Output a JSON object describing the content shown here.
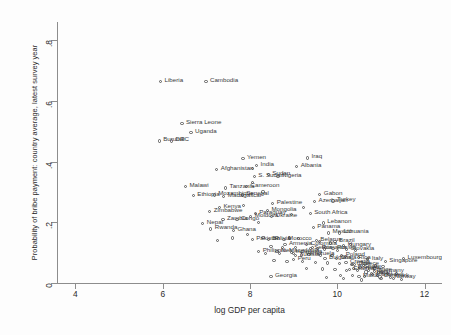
{
  "chart_data": {
    "type": "scatter",
    "title": "",
    "xlabel": "log GDP per capita",
    "ylabel": "Probability of bribe payment: country average, latest survey year",
    "xlim": [
      3.6,
      12.4
    ],
    "ylim": [
      0,
      0.86
    ],
    "xticks": [
      4,
      6,
      8,
      10,
      12
    ],
    "xticklabels": [
      "4",
      "6",
      "8",
      "10",
      "12"
    ],
    "yticks": [
      0,
      0.2,
      0.4,
      0.6,
      0.8
    ],
    "yticklabels": [
      "0",
      ".2",
      ".4",
      ".6",
      ".8"
    ],
    "grid": false,
    "legend": null,
    "marker": "open-circle",
    "marker_color": "#5a5a5a",
    "label_color": "#3a3a3a",
    "points": [
      {
        "label": "Liberia",
        "x": 5.95,
        "y": 0.665,
        "side": "right"
      },
      {
        "label": "Cambodia",
        "x": 6.99,
        "y": 0.665,
        "side": "right"
      },
      {
        "label": "Sierra Leone",
        "x": 6.44,
        "y": 0.525,
        "side": "right"
      },
      {
        "label": "Uganda",
        "x": 6.65,
        "y": 0.497,
        "side": "right"
      },
      {
        "label": "Burundi",
        "x": 5.92,
        "y": 0.468,
        "side": "right"
      },
      {
        "label": "DRC",
        "x": 6.2,
        "y": 0.468,
        "side": "right"
      },
      {
        "label": "Yemen",
        "x": 7.84,
        "y": 0.41,
        "side": "right"
      },
      {
        "label": "Iraq",
        "x": 9.32,
        "y": 0.412,
        "side": "right"
      },
      {
        "label": "India",
        "x": 8.15,
        "y": 0.388,
        "side": "right"
      },
      {
        "label": "Liberia2",
        "x": 8.05,
        "y": 0.378,
        "side": "right"
      },
      {
        "label": "Albania",
        "x": 9.07,
        "y": 0.385,
        "side": "right"
      },
      {
        "label": "Afghanistan",
        "x": 7.24,
        "y": 0.375,
        "side": "right"
      },
      {
        "label": "Sudan",
        "x": 8.42,
        "y": 0.358,
        "side": "right"
      },
      {
        "label": "S. Sudan",
        "x": 8.1,
        "y": 0.352,
        "side": "right"
      },
      {
        "label": "Nigeria",
        "x": 8.64,
        "y": 0.352,
        "side": "right"
      },
      {
        "label": "Malawi",
        "x": 6.52,
        "y": 0.318,
        "side": "right"
      },
      {
        "label": "Tanzania",
        "x": 7.44,
        "y": 0.313,
        "side": "right"
      },
      {
        "label": "Cameroon",
        "x": 7.92,
        "y": 0.318,
        "side": "right"
      },
      {
        "label": "Ethiopia",
        "x": 6.7,
        "y": 0.288,
        "side": "right"
      },
      {
        "label": "Mozambique",
        "x": 7.18,
        "y": 0.29,
        "side": "right"
      },
      {
        "label": "Senegal",
        "x": 7.82,
        "y": 0.29,
        "side": "right"
      },
      {
        "label": "Madagascar",
        "x": 7.4,
        "y": 0.285,
        "side": "right"
      },
      {
        "label": "Gabon",
        "x": 9.6,
        "y": 0.292,
        "side": "right"
      },
      {
        "label": "Azerbaijan",
        "x": 9.48,
        "y": 0.268,
        "side": "right"
      },
      {
        "label": "Turkey",
        "x": 9.9,
        "y": 0.27,
        "side": "right"
      },
      {
        "label": "Palestine",
        "x": 8.52,
        "y": 0.262,
        "side": "right"
      },
      {
        "label": "Kenya",
        "x": 7.3,
        "y": 0.248,
        "side": "right"
      },
      {
        "label": "Mongolia",
        "x": 8.4,
        "y": 0.24,
        "side": "right"
      },
      {
        "label": "Zimbabwe",
        "x": 7.08,
        "y": 0.235,
        "side": "right"
      },
      {
        "label": "Paraguay",
        "x": 8.12,
        "y": 0.23,
        "side": "right"
      },
      {
        "label": "South Africa",
        "x": 9.38,
        "y": 0.228,
        "side": "right"
      },
      {
        "label": "Moldova",
        "x": 8.02,
        "y": 0.218,
        "side": "right"
      },
      {
        "label": "Ukraine",
        "x": 8.5,
        "y": 0.218,
        "side": "right"
      },
      {
        "label": "Zambia",
        "x": 7.38,
        "y": 0.208,
        "side": "right"
      },
      {
        "label": "Congo",
        "x": 7.7,
        "y": 0.208,
        "side": "right"
      },
      {
        "label": "Nepal",
        "x": 6.92,
        "y": 0.195,
        "side": "right"
      },
      {
        "label": "Lebanon",
        "x": 9.68,
        "y": 0.198,
        "side": "right"
      },
      {
        "label": "Panama",
        "x": 9.45,
        "y": 0.182,
        "side": "right"
      },
      {
        "label": "Rwanda",
        "x": 7.1,
        "y": 0.178,
        "side": "right"
      },
      {
        "label": "Ghana",
        "x": 7.62,
        "y": 0.172,
        "side": "right"
      },
      {
        "label": "Mexico",
        "x": 9.8,
        "y": 0.165,
        "side": "right"
      },
      {
        "label": "Lithuania",
        "x": 10.05,
        "y": 0.165,
        "side": "right"
      },
      {
        "label": "Pakistan",
        "x": 8.05,
        "y": 0.142,
        "side": "right"
      },
      {
        "label": "Bolivia",
        "x": 8.42,
        "y": 0.142,
        "side": "right"
      },
      {
        "label": "Morocco",
        "x": 8.78,
        "y": 0.142,
        "side": "right"
      },
      {
        "label": "Belarus",
        "x": 9.52,
        "y": 0.14,
        "side": "right"
      },
      {
        "label": "Brazil",
        "x": 9.95,
        "y": 0.138,
        "side": "right"
      },
      {
        "label": "Armenia",
        "x": 8.8,
        "y": 0.126,
        "side": "right"
      },
      {
        "label": "Colombia",
        "x": 9.3,
        "y": 0.126,
        "side": "right"
      },
      {
        "label": "Hungary",
        "x": 10.15,
        "y": 0.124,
        "side": "right"
      },
      {
        "label": "Serbia",
        "x": 9.38,
        "y": 0.113,
        "side": "right"
      },
      {
        "label": "Romania",
        "x": 9.55,
        "y": 0.113,
        "side": "right"
      },
      {
        "label": "Russia",
        "x": 9.9,
        "y": 0.113,
        "side": "right"
      },
      {
        "label": "Slovakia",
        "x": 10.22,
        "y": 0.11,
        "side": "right"
      },
      {
        "label": "N. Macedonia",
        "x": 8.62,
        "y": 0.105,
        "side": "right"
      },
      {
        "label": "Philippines",
        "x": 8.2,
        "y": 0.103,
        "side": "right"
      },
      {
        "label": "Indonesia",
        "x": 8.95,
        "y": 0.1,
        "side": "right"
      },
      {
        "label": "Venezuela",
        "x": 9.18,
        "y": 0.092,
        "side": "right"
      },
      {
        "label": "Tunisia",
        "x": 9.05,
        "y": 0.09,
        "side": "right"
      },
      {
        "label": "Poland",
        "x": 10.1,
        "y": 0.09,
        "side": "right"
      },
      {
        "label": "Bulgaria",
        "x": 9.72,
        "y": 0.082,
        "side": "right"
      },
      {
        "label": "Costa Rica",
        "x": 9.98,
        "y": 0.082,
        "side": "right"
      },
      {
        "label": "Peru",
        "x": 9.0,
        "y": 0.078,
        "side": "right"
      },
      {
        "label": "Croatia",
        "x": 10.2,
        "y": 0.068,
        "side": "right"
      },
      {
        "label": "Chile",
        "x": 10.35,
        "y": 0.062,
        "side": "right"
      },
      {
        "label": "Greece",
        "x": 10.4,
        "y": 0.062,
        "side": "right"
      },
      {
        "label": "Italy",
        "x": 10.7,
        "y": 0.078,
        "side": "right"
      },
      {
        "label": "Singapore",
        "x": 11.1,
        "y": 0.07,
        "side": "right"
      },
      {
        "label": "Luxembourg",
        "x": 11.52,
        "y": 0.08,
        "side": "right"
      },
      {
        "label": "Spain",
        "x": 10.52,
        "y": 0.052,
        "side": "right"
      },
      {
        "label": "Portugal",
        "x": 10.38,
        "y": 0.048,
        "side": "right"
      },
      {
        "label": "Estonia",
        "x": 10.28,
        "y": 0.045,
        "side": "right"
      },
      {
        "label": "France",
        "x": 10.72,
        "y": 0.042,
        "side": "right"
      },
      {
        "label": "Germany",
        "x": 10.85,
        "y": 0.038,
        "side": "right"
      },
      {
        "label": "Japan",
        "x": 10.78,
        "y": 0.032,
        "side": "right"
      },
      {
        "label": "UK",
        "x": 10.8,
        "y": 0.028,
        "side": "right"
      },
      {
        "label": "Sweden",
        "x": 10.92,
        "y": 0.024,
        "side": "right"
      },
      {
        "label": "Denmark",
        "x": 10.98,
        "y": 0.02,
        "side": "right"
      },
      {
        "label": "Norway",
        "x": 11.22,
        "y": 0.018,
        "side": "right"
      },
      {
        "label": "Malta",
        "x": 10.5,
        "y": 0.022,
        "side": "right"
      },
      {
        "label": "Georgia",
        "x": 8.48,
        "y": 0.022,
        "side": "right"
      }
    ],
    "extra_points": [
      {
        "x": 8.3,
        "y": 0.15
      },
      {
        "x": 8.62,
        "y": 0.15
      },
      {
        "x": 8.9,
        "y": 0.148
      },
      {
        "x": 9.12,
        "y": 0.146
      },
      {
        "x": 9.6,
        "y": 0.136
      },
      {
        "x": 9.85,
        "y": 0.132
      },
      {
        "x": 10.3,
        "y": 0.128
      },
      {
        "x": 8.48,
        "y": 0.12
      },
      {
        "x": 8.74,
        "y": 0.118
      },
      {
        "x": 9.05,
        "y": 0.118
      },
      {
        "x": 9.44,
        "y": 0.116
      },
      {
        "x": 9.7,
        "y": 0.112
      },
      {
        "x": 10.0,
        "y": 0.108
      },
      {
        "x": 10.42,
        "y": 0.106
      },
      {
        "x": 8.35,
        "y": 0.098
      },
      {
        "x": 8.68,
        "y": 0.096
      },
      {
        "x": 9.0,
        "y": 0.096
      },
      {
        "x": 9.35,
        "y": 0.094
      },
      {
        "x": 9.62,
        "y": 0.092
      },
      {
        "x": 9.88,
        "y": 0.09
      },
      {
        "x": 10.18,
        "y": 0.086
      },
      {
        "x": 10.48,
        "y": 0.084
      },
      {
        "x": 10.7,
        "y": 0.082
      },
      {
        "x": 8.55,
        "y": 0.074
      },
      {
        "x": 8.85,
        "y": 0.072
      },
      {
        "x": 9.2,
        "y": 0.07
      },
      {
        "x": 9.5,
        "y": 0.068
      },
      {
        "x": 9.78,
        "y": 0.066
      },
      {
        "x": 10.05,
        "y": 0.064
      },
      {
        "x": 10.32,
        "y": 0.06
      },
      {
        "x": 10.6,
        "y": 0.058
      },
      {
        "x": 10.88,
        "y": 0.056
      },
      {
        "x": 11.05,
        "y": 0.054
      },
      {
        "x": 9.3,
        "y": 0.048
      },
      {
        "x": 9.66,
        "y": 0.046
      },
      {
        "x": 9.95,
        "y": 0.044
      },
      {
        "x": 10.22,
        "y": 0.042
      },
      {
        "x": 10.46,
        "y": 0.04
      },
      {
        "x": 10.66,
        "y": 0.036
      },
      {
        "x": 10.95,
        "y": 0.034
      },
      {
        "x": 11.15,
        "y": 0.032
      },
      {
        "x": 11.35,
        "y": 0.03
      },
      {
        "x": 10.08,
        "y": 0.026
      },
      {
        "x": 10.35,
        "y": 0.024
      },
      {
        "x": 10.62,
        "y": 0.022
      },
      {
        "x": 11.0,
        "y": 0.016
      },
      {
        "x": 11.28,
        "y": 0.014
      },
      {
        "x": 11.48,
        "y": 0.012
      },
      {
        "x": 9.75,
        "y": 0.018
      },
      {
        "x": 10.15,
        "y": 0.014
      },
      {
        "x": 10.55,
        "y": 0.01
      },
      {
        "x": 7.95,
        "y": 0.16
      },
      {
        "x": 7.6,
        "y": 0.148
      },
      {
        "x": 7.25,
        "y": 0.14
      },
      {
        "x": 8.2,
        "y": 0.2
      },
      {
        "x": 7.85,
        "y": 0.255
      },
      {
        "x": 8.95,
        "y": 0.225
      },
      {
        "x": 9.22,
        "y": 0.25
      },
      {
        "x": 8.05,
        "y": 0.33
      },
      {
        "x": 8.3,
        "y": 0.3
      }
    ]
  }
}
